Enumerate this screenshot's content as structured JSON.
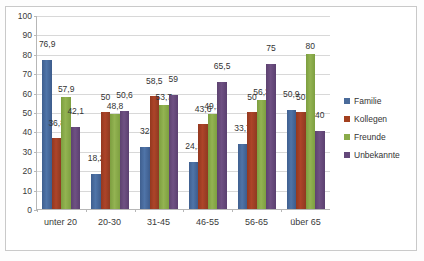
{
  "chart_data": {
    "type": "bar",
    "title": "",
    "subtitle": "",
    "xlabel": "",
    "ylabel": "",
    "ylim": [
      0,
      100
    ],
    "ytick_step": 10,
    "yticks": [
      100,
      90,
      80,
      70,
      60,
      50,
      40,
      30,
      20,
      10,
      0
    ],
    "grid": true,
    "legend_position": "right",
    "categories": [
      "unter 20",
      "20-30",
      "31-45",
      "46-55",
      "56-65",
      "über 65"
    ],
    "series": [
      {
        "name": "Familie",
        "color": "#4a6b9a",
        "values": [
          76.9,
          18.2,
          32,
          24.1,
          33.7,
          50.9
        ],
        "labels": [
          "76,9",
          "18,2",
          "32",
          "24,1",
          "33,7",
          "50,9"
        ]
      },
      {
        "name": "Kollegen",
        "color": "#a3401f",
        "values": [
          36.8,
          50,
          58.5,
          43.6,
          50,
          50
        ],
        "labels": [
          "36,8",
          "50",
          "58,5",
          "43,6",
          "50",
          "50"
        ]
      },
      {
        "name": "Freunde",
        "color": "#8aab4a",
        "values": [
          57.9,
          48.8,
          53.7,
          49.1,
          56.3,
          80
        ],
        "labels": [
          "57,9",
          "48,8",
          "53,7",
          "49,1",
          "56,3",
          "80"
        ]
      },
      {
        "name": "Unbekannte",
        "color": "#64487a",
        "values": [
          42.1,
          50.6,
          59,
          65.5,
          75,
          40
        ],
        "labels": [
          "42,1",
          "50,6",
          "59",
          "65,5",
          "75",
          "40"
        ]
      }
    ]
  }
}
